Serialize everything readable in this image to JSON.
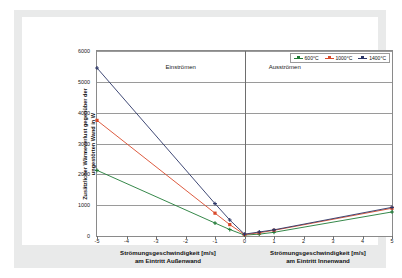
{
  "chart_data": {
    "type": "line",
    "title": "",
    "xlabel_left_line1": "Strömungsgeschwindigkeit [m/s]",
    "xlabel_left_line2": "am Eintritt Außenwand",
    "xlabel_right_line1": "Strömungsgeschwindigkeit [m/s]",
    "xlabel_right_line2": "am Eintritt Innenwand",
    "ylabel_line1": "Zusätzlicher Wärmeverlust gegenüber der",
    "ylabel_line2": "ungestörten Wand in W",
    "xlim": [
      -5,
      5
    ],
    "ylim": [
      0,
      6000
    ],
    "xticks": [
      "-5",
      "-4",
      "-3",
      "-2",
      "-1",
      "0",
      "1",
      "2",
      "3",
      "4",
      "5"
    ],
    "xtick_values": [
      -5,
      -4,
      -3,
      -2,
      -1,
      0,
      1,
      2,
      3,
      4,
      5
    ],
    "yticks": [
      "0",
      "1000",
      "2000",
      "3000",
      "4000",
      "5000",
      "6000"
    ],
    "ytick_values": [
      0,
      1000,
      2000,
      3000,
      4000,
      5000,
      6000
    ],
    "grid": "horizontal",
    "legend_position": "top-right",
    "annotations": [
      {
        "text": "Einströmen",
        "x": -2.0,
        "y": 5450
      },
      {
        "text": "Ausströmen",
        "x": 1.5,
        "y": 5450
      }
    ],
    "x": [
      -5,
      -1,
      -0.5,
      0,
      0.5,
      1,
      5
    ],
    "series": [
      {
        "name": "600°C",
        "color": "#1f7a35",
        "marker": "cross",
        "values": [
          2130,
          420,
          210,
          30,
          60,
          120,
          780
        ]
      },
      {
        "name": "1000°C",
        "color": "#d94a2b",
        "marker": "square",
        "values": [
          3750,
          740,
          370,
          45,
          105,
          185,
          900
        ]
      },
      {
        "name": "1400°C",
        "color": "#2b3566",
        "marker": "cross",
        "values": [
          5450,
          1050,
          520,
          60,
          130,
          200,
          930
        ]
      }
    ]
  },
  "legend": {
    "items": [
      {
        "label": "600°C",
        "color": "#1f7a35"
      },
      {
        "label": "1000°C",
        "color": "#d94a2b"
      },
      {
        "label": "1400°C",
        "color": "#2b3566"
      }
    ]
  },
  "colors": {
    "series_600": "#1f7a35",
    "series_1000": "#d94a2b",
    "series_1400": "#2b3566",
    "grid": "#9a9a9a",
    "frame": "#8a8a8a",
    "mat": "#e9eaea",
    "page": "#ffffff"
  }
}
